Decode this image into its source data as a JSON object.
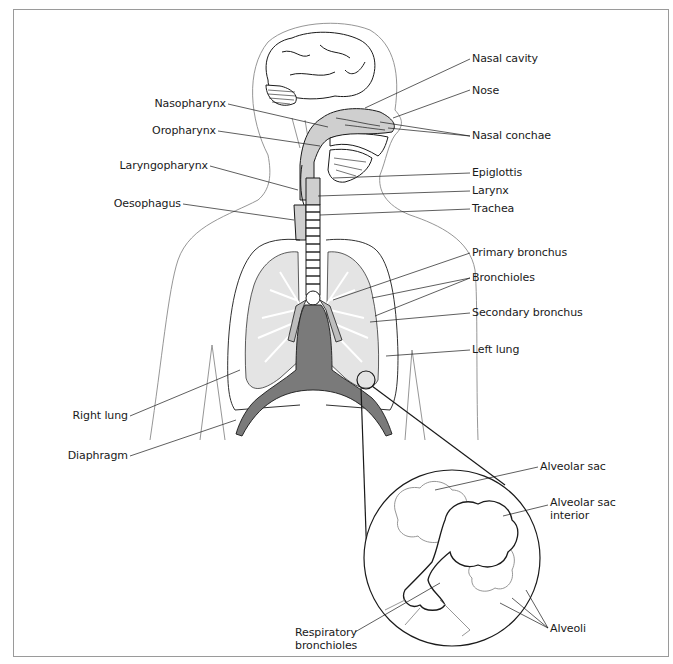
{
  "figure": {
    "colors": {
      "outline": "#1a1a1a",
      "body_outline": "#8a8a8a",
      "airway_fill": "#cfcfcf",
      "diaphragm_fill": "#7a7a7a",
      "lung_fill": "#e4e4e4",
      "frame": "#9a9a9a"
    }
  },
  "labels": {
    "nasal_cavity": "Nasal cavity",
    "nose": "Nose",
    "nasal_conchae": "Nasal conchae",
    "nasopharynx": "Nasopharynx",
    "oropharynx": "Oropharynx",
    "laryngopharynx": "Laryngopharynx",
    "oesophagus": "Oesophagus",
    "epiglottis": "Epiglottis",
    "larynx": "Larynx",
    "trachea": "Trachea",
    "primary_bronchus": "Primary bronchus",
    "bronchioles": "Bronchioles",
    "secondary_bronchus": "Secondary bronchus",
    "left_lung": "Left lung",
    "right_lung": "Right lung",
    "diaphragm": "Diaphragm",
    "alveolar_sac": "Alveolar sac",
    "alveolar_sac_interior_1": "Alveolar sac",
    "alveolar_sac_interior_2": "interior",
    "alveoli": "Alveoli",
    "respiratory_bronchioles_1": "Respiratory",
    "respiratory_bronchioles_2": "bronchioles"
  }
}
